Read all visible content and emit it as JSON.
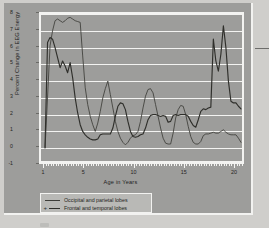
{
  "figure": {
    "background_color": "#9d9d9b",
    "plot_background_color": "#9d9d9b",
    "grid_color": "#f3f3f1",
    "series_color": "#3a3a36"
  },
  "chart_data": {
    "type": "line",
    "title": "",
    "xlabel": "Age in Years",
    "ylabel": "Percent Change in EEG Energy",
    "xlim": [
      0.6,
      21.0
    ],
    "ylim": [
      -1,
      8
    ],
    "grid": true,
    "xticks_major": [
      1,
      5,
      10,
      15,
      20
    ],
    "xtick_labels": [
      "1",
      "5",
      "10",
      "15",
      "20"
    ],
    "yticks": [
      -1,
      0,
      1,
      2,
      3,
      4,
      5,
      6,
      7,
      8
    ],
    "ytick_labels": [
      "-1",
      "0",
      "1",
      "2",
      "3",
      "4",
      "5",
      "6",
      "7",
      "8"
    ],
    "legend_position": "below-axes",
    "series": [
      {
        "name": "Occipital and parietal lobes",
        "marker": "none",
        "color": "#3d3d39",
        "x": [
          1.0,
          1.25,
          1.5,
          1.75,
          2.0,
          2.25,
          2.5,
          2.75,
          3.0,
          3.25,
          3.5,
          3.75,
          4.0,
          4.25,
          4.5,
          4.75,
          5.0,
          5.25,
          5.5,
          5.75,
          6.0,
          6.25,
          6.5,
          6.75,
          7.0,
          7.25,
          7.5,
          7.75,
          8.0,
          8.25,
          8.5,
          8.75,
          9.0,
          9.25,
          9.5,
          9.75,
          10.0,
          10.25,
          10.5,
          10.75,
          11.0,
          11.25,
          11.5,
          11.75,
          12.0,
          12.25,
          12.5,
          12.75,
          13.0,
          13.25,
          13.5,
          13.75,
          14.0,
          14.25,
          14.5,
          14.75,
          15.0,
          15.25,
          15.5,
          15.75,
          16.0,
          16.25,
          16.5,
          16.75,
          17.0,
          17.25,
          17.5,
          17.75,
          18.0,
          18.25,
          18.5,
          18.75,
          19.0,
          19.25,
          19.5,
          19.75,
          20.0,
          20.25,
          20.5
        ],
        "y": [
          0.0,
          3.0,
          6.1,
          7.0,
          7.6,
          7.7,
          7.6,
          7.5,
          7.6,
          7.75,
          7.8,
          7.7,
          7.6,
          7.55,
          7.5,
          5.5,
          3.6,
          2.6,
          1.9,
          1.4,
          1.0,
          1.5,
          2.2,
          3.0,
          3.55,
          4.0,
          3.2,
          2.4,
          1.6,
          1.0,
          0.6,
          0.35,
          0.2,
          0.35,
          0.6,
          0.75,
          0.8,
          1.0,
          1.6,
          2.4,
          3.1,
          3.5,
          3.55,
          3.3,
          2.6,
          1.9,
          1.2,
          0.6,
          0.3,
          0.25,
          0.25,
          0.9,
          1.8,
          2.3,
          2.55,
          2.5,
          2.0,
          1.3,
          0.7,
          0.35,
          0.25,
          0.25,
          0.4,
          0.75,
          0.85,
          0.85,
          0.9,
          0.95,
          0.9,
          0.9,
          1.0,
          1.1,
          0.95,
          0.85,
          0.8,
          0.8,
          0.8,
          0.6,
          0.35
        ]
      },
      {
        "name": "Frontal and temporal lobes",
        "marker": "plus",
        "color": "#2f2f2b",
        "x": [
          1.0,
          1.25,
          1.5,
          1.75,
          2.0,
          2.25,
          2.5,
          2.75,
          3.0,
          3.25,
          3.5,
          3.75,
          4.0,
          4.25,
          4.5,
          4.75,
          5.0,
          5.25,
          5.5,
          5.75,
          6.0,
          6.25,
          6.5,
          6.75,
          7.0,
          7.25,
          7.5,
          7.75,
          8.0,
          8.25,
          8.5,
          8.75,
          9.0,
          9.25,
          9.5,
          9.75,
          10.0,
          10.25,
          10.5,
          10.75,
          11.0,
          11.25,
          11.5,
          11.75,
          12.0,
          12.25,
          12.5,
          12.75,
          13.0,
          13.25,
          13.5,
          13.75,
          14.0,
          14.25,
          14.5,
          14.75,
          15.0,
          15.25,
          15.5,
          15.75,
          16.0,
          16.25,
          16.5,
          16.75,
          17.0,
          17.25,
          17.5,
          17.75,
          18.0,
          18.25,
          18.5,
          18.75,
          19.0,
          19.25,
          19.5,
          19.75,
          20.0,
          20.25,
          20.5
        ],
        "y": [
          0.05,
          6.3,
          6.6,
          6.5,
          6.0,
          5.4,
          4.8,
          5.2,
          4.9,
          4.5,
          5.1,
          4.2,
          3.0,
          2.1,
          1.4,
          1.0,
          0.8,
          0.65,
          0.55,
          0.5,
          0.5,
          0.55,
          0.8,
          0.85,
          0.85,
          0.85,
          0.85,
          1.2,
          1.9,
          2.5,
          2.7,
          2.65,
          2.3,
          1.6,
          1.0,
          0.7,
          0.65,
          0.7,
          0.8,
          0.85,
          1.2,
          1.7,
          1.95,
          2.0,
          2.0,
          1.95,
          1.9,
          1.95,
          1.9,
          1.55,
          1.6,
          1.95,
          2.0,
          1.95,
          2.0,
          2.0,
          2.0,
          1.9,
          1.6,
          1.35,
          1.25,
          1.7,
          2.2,
          2.35,
          2.3,
          2.4,
          2.45,
          6.5,
          5.2,
          4.6,
          5.6,
          7.3,
          6.0,
          4.0,
          2.8,
          2.7,
          2.7,
          2.5,
          2.35
        ]
      }
    ]
  },
  "legend": {
    "items": [
      {
        "label": "Occipital and parietal lobes",
        "marker": "line"
      },
      {
        "label": "Frontal and temporal lobes",
        "marker": "plus-line"
      }
    ]
  }
}
